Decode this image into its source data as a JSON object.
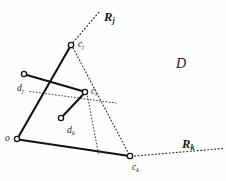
{
  "figure": {
    "background_color": "#fefefe",
    "stroke_color": "#1a1a1a",
    "label_color": "#1a1a1a",
    "width": 226,
    "height": 181
  },
  "labels": {
    "ray_j": {
      "base": "R",
      "sub": "j",
      "x": 104,
      "y": 11
    },
    "ray_k": {
      "base": "R",
      "sub": "k",
      "x": 182,
      "y": 138
    },
    "region_d": {
      "base": "D",
      "sub": "",
      "x": 176,
      "y": 57
    },
    "point_cj": {
      "base": "c",
      "sub": "j",
      "x": 78,
      "y": 40
    },
    "point_ci": {
      "base": "c",
      "sub": "i",
      "x": 91,
      "y": 87
    },
    "point_ck": {
      "base": "c",
      "sub": "k",
      "x": 132,
      "y": 163
    },
    "point_dj": {
      "base": "d",
      "sub": "j",
      "x": 17,
      "y": 84
    },
    "point_dk": {
      "base": "d",
      "sub": "k",
      "x": 67,
      "y": 126
    },
    "point_o": {
      "base": "o",
      "sub": "",
      "x": 5,
      "y": 139
    }
  },
  "vertices": {
    "o": {
      "x": 17,
      "y": 139,
      "marker": "open-circle"
    },
    "cj": {
      "x": 71,
      "y": 45,
      "marker": "open-circle"
    },
    "ck": {
      "x": 130,
      "y": 156,
      "marker": "open-circle"
    },
    "ci": {
      "x": 85,
      "y": 92,
      "marker": "open-circle"
    },
    "dj": {
      "x": 24,
      "y": 74,
      "marker": "open-circle"
    },
    "dk": {
      "x": 61,
      "y": 118,
      "marker": "open-circle"
    }
  },
  "solid_segments": [
    {
      "name": "o-cj",
      "from": "o",
      "to": "cj"
    },
    {
      "name": "o-ck",
      "from": "o",
      "to": "ck"
    },
    {
      "name": "dj-ci",
      "from": "dj",
      "to": "ci"
    },
    {
      "name": "dk-ci",
      "from": "dk",
      "to": "ci"
    }
  ],
  "dotted_segments": [
    {
      "name": "ray-j-extension",
      "x1": 71,
      "y1": 45,
      "x2": 99,
      "y2": 12
    },
    {
      "name": "cj-ck-dotted-edge",
      "x1": 71,
      "y1": 45,
      "x2": 130,
      "y2": 156
    },
    {
      "name": "ray-k-extension",
      "x1": 130,
      "y1": 156,
      "x2": 222,
      "y2": 148
    },
    {
      "name": "ci-horizontal-guide",
      "x1": 30,
      "y1": 92,
      "x2": 115,
      "y2": 103
    },
    {
      "name": "ci-vertical-guide",
      "x1": 88,
      "y1": 95,
      "x2": 98,
      "y2": 153
    }
  ],
  "region_fill": null
}
